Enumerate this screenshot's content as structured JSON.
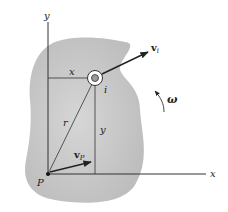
{
  "diagram": {
    "type": "rigid-body-rotation",
    "colors": {
      "body_fill": "#c8c8c8",
      "line": "#333333",
      "background": "#ffffff"
    },
    "labels": {
      "y_axis": "y",
      "x_axis": "x",
      "x_distance": "x",
      "y_distance": "y",
      "radius": "r",
      "point_i": "i",
      "point_P": "P",
      "velocity_i": "v",
      "velocity_i_sub": "i",
      "velocity_P": "v",
      "velocity_P_sub": "P",
      "angular_velocity": "ω"
    }
  }
}
